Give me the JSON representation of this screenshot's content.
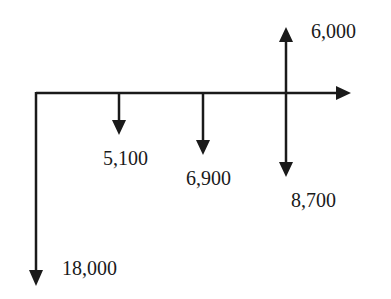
{
  "diagram": {
    "type": "cash-flow-diagram",
    "timeline": {
      "direction": "right"
    },
    "flows": [
      {
        "position": 0,
        "direction": "down",
        "label": "18,000"
      },
      {
        "position": 1,
        "direction": "down",
        "label": "5,100"
      },
      {
        "position": 2,
        "direction": "down",
        "label": "6,900"
      },
      {
        "position": 3,
        "direction": "down",
        "label": "8,700"
      },
      {
        "position": 3,
        "direction": "up",
        "label": "6,000"
      }
    ]
  }
}
